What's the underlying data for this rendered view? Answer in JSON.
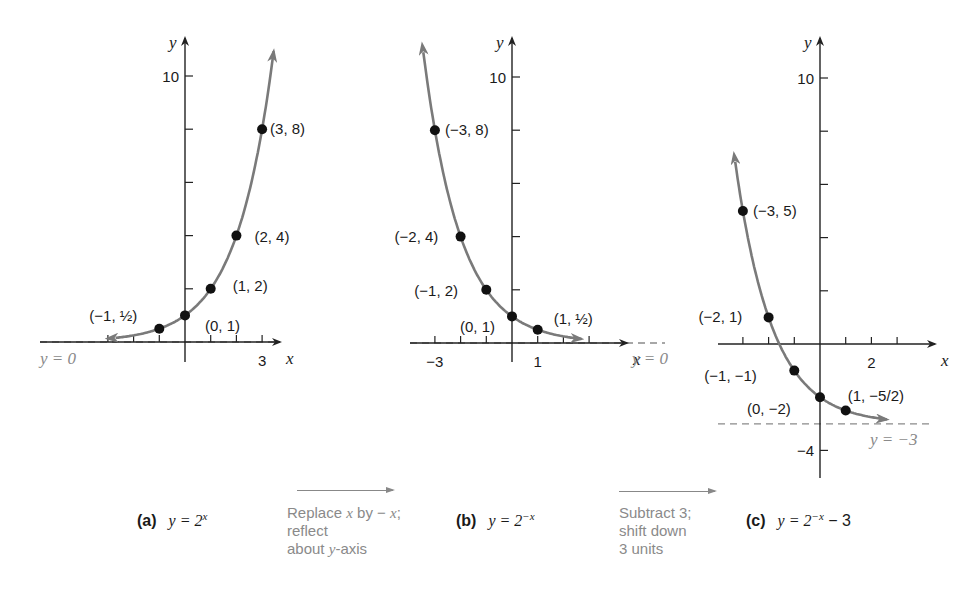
{
  "chart_data": [
    {
      "type": "line",
      "panel": "a",
      "title": "y = 2^x",
      "caption_label": "(a)",
      "caption_equation": "y = 2",
      "caption_exponent": "x",
      "xlabel": "x",
      "ylabel": "y",
      "x_tick_labels": [
        {
          "value": 3,
          "label": "3"
        }
      ],
      "y_tick_labels": [
        {
          "value": 10,
          "label": "10"
        }
      ],
      "x_ticks": [
        -3,
        -2,
        -1,
        0,
        1,
        2,
        3
      ],
      "y_ticks": [
        2,
        4,
        6,
        8,
        10
      ],
      "asymptote": {
        "y": 0,
        "label": "y = 0"
      },
      "points": [
        {
          "x": -1,
          "y": 0.5,
          "label": "(−1, ½)"
        },
        {
          "x": 0,
          "y": 1,
          "label": "(0, 1)"
        },
        {
          "x": 1,
          "y": 2,
          "label": "(1, 2)"
        },
        {
          "x": 2,
          "y": 4,
          "label": "(2, 4)"
        },
        {
          "x": 3,
          "y": 8,
          "label": "(3, 8)"
        }
      ],
      "xlim": [
        -3.5,
        4
      ],
      "ylim": [
        0,
        10.5
      ]
    },
    {
      "type": "line",
      "panel": "b",
      "title": "y = 2^-x",
      "caption_label": "(b)",
      "caption_equation": "y = 2",
      "caption_exponent": "−x",
      "xlabel": "x",
      "ylabel": "y",
      "x_tick_labels": [
        {
          "value": -3,
          "label": "−3"
        },
        {
          "value": 1,
          "label": "1"
        }
      ],
      "y_tick_labels": [
        {
          "value": 10,
          "label": "10"
        }
      ],
      "x_ticks": [
        -3,
        -2,
        -1,
        0,
        1,
        2,
        3
      ],
      "y_ticks": [
        2,
        4,
        6,
        8,
        10
      ],
      "asymptote": {
        "y": 0,
        "label": "y = 0"
      },
      "points": [
        {
          "x": -3,
          "y": 8,
          "label": "(−3, 8)"
        },
        {
          "x": -2,
          "y": 4,
          "label": "(−2, 4)"
        },
        {
          "x": -1,
          "y": 2,
          "label": "(−1, 2)"
        },
        {
          "x": 0,
          "y": 1,
          "label": "(0, 1)"
        },
        {
          "x": 1,
          "y": 0.5,
          "label": "(1, ½)"
        }
      ],
      "xlim": [
        -4,
        3.5
      ],
      "ylim": [
        0,
        10.5
      ]
    },
    {
      "type": "line",
      "panel": "c",
      "title": "y = 2^-x − 3",
      "caption_label": "(c)",
      "caption_equation": "y = 2",
      "caption_exponent": "−x",
      "caption_suffix": " − 3",
      "xlabel": "x",
      "ylabel": "y",
      "x_tick_labels": [
        {
          "value": 2,
          "label": "2"
        }
      ],
      "y_tick_labels": [
        {
          "value": 10,
          "label": "10"
        },
        {
          "value": -4,
          "label": "−4"
        }
      ],
      "x_ticks": [
        -3,
        -2,
        -1,
        0,
        1,
        2,
        3
      ],
      "y_ticks": [
        -4,
        2,
        4,
        6,
        8,
        10
      ],
      "asymptote": {
        "y": -3,
        "label": "y = −3"
      },
      "points": [
        {
          "x": -3,
          "y": 5,
          "label": "(−3, 5)"
        },
        {
          "x": -2,
          "y": 1,
          "label": "(−2, 1)"
        },
        {
          "x": -1,
          "y": -1,
          "label": "(−1, −1)"
        },
        {
          "x": 0,
          "y": -2,
          "label": "(0, −2)"
        },
        {
          "x": 1,
          "y": -2.5,
          "label": "(1, −5/2)"
        }
      ],
      "xlim": [
        -4,
        4
      ],
      "ylim": [
        -5,
        10.5
      ]
    }
  ],
  "transforms": [
    {
      "arrow": "right",
      "line1_pre": "Replace ",
      "line1_var": "x",
      "line1_mid": " by − ",
      "line1_var2": "x",
      "line1_post": ";",
      "line2": "reflect",
      "line3_pre": "about ",
      "line3_var": "y",
      "line3_post": "-axis"
    },
    {
      "arrow": "right",
      "line1": "Subtract 3;",
      "line2": "shift down",
      "line3": "3 units"
    }
  ],
  "colors": {
    "curve": "#7a7a7a",
    "axis": "#222222",
    "point": "#111111",
    "asymptote": "#8a8a8a",
    "annotation": "#8a8a8a"
  }
}
